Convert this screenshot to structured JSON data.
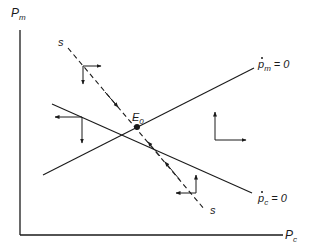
{
  "axes": {
    "y_label": "P",
    "y_label_sub": "m",
    "x_label": "P",
    "x_label_sub": "c"
  },
  "curves": {
    "pm_dot_zero": {
      "label_var": "p",
      "label_sub": "m",
      "label_eq": "= 0"
    },
    "pc_dot_zero": {
      "label_var": "p",
      "label_sub": "c",
      "label_eq": "= 0"
    },
    "saddle_path": {
      "label_top": "s",
      "label_bottom": "s"
    }
  },
  "equilibrium": {
    "label": "E",
    "label_sub": "0"
  },
  "colors": {
    "ink": "#1a1a1a",
    "background": "#ffffff"
  }
}
